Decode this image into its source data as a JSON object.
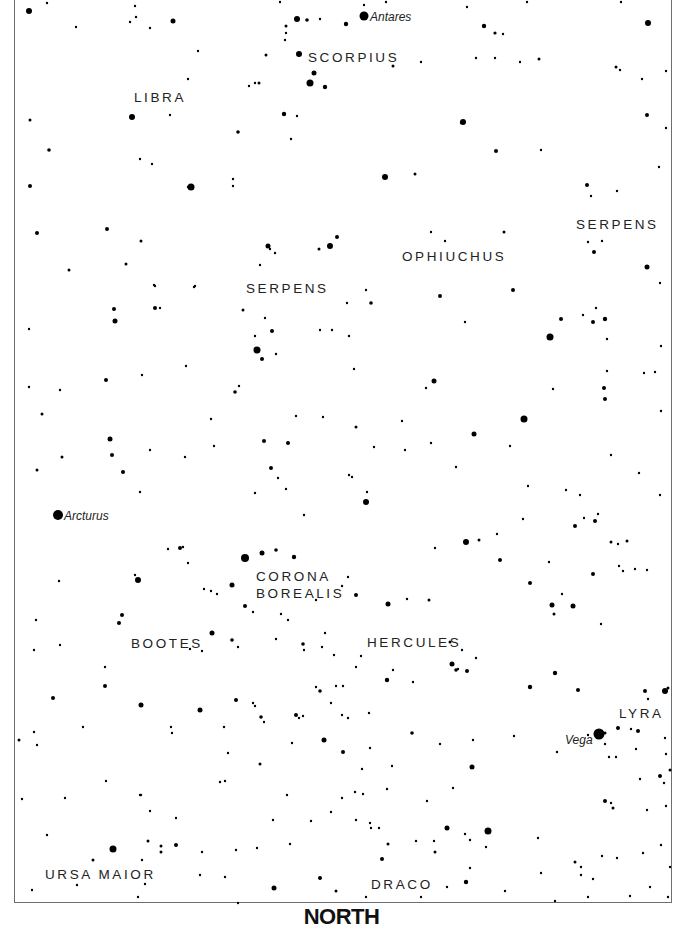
{
  "chart": {
    "direction_label": "NORTH",
    "frame": {
      "left": 14,
      "right": 672,
      "bottom": 904
    },
    "colors": {
      "star": "#000000",
      "label": "#222222",
      "frame": "#6e6e6e",
      "background": "#ffffff"
    }
  },
  "constellations": [
    {
      "name": "SCORPIUS",
      "x": 308,
      "y": 62
    },
    {
      "name": "LIBRA",
      "x": 134,
      "y": 102
    },
    {
      "name": "SERPENS",
      "x": 576,
      "y": 229
    },
    {
      "name": "OPHIUCHUS",
      "x": 402,
      "y": 261
    },
    {
      "name": "SERPENS",
      "x": 246,
      "y": 293
    },
    {
      "name": "CORONA",
      "x": 256,
      "y": 581
    },
    {
      "name": "BOREALIS",
      "x": 256,
      "y": 598
    },
    {
      "name": "BOOTES",
      "x": 131,
      "y": 648
    },
    {
      "name": "HERCULES",
      "x": 367,
      "y": 647
    },
    {
      "name": "LYRA",
      "x": 619,
      "y": 718
    },
    {
      "name": "URSA MAIOR",
      "x": 45,
      "y": 879
    },
    {
      "name": "DRACO",
      "x": 371,
      "y": 889
    }
  ],
  "named_stars": [
    {
      "name": "Antares",
      "x": 364,
      "y": 16,
      "r": 4.5,
      "label_x": 370,
      "label_y": 21
    },
    {
      "name": "Arcturus",
      "x": 58,
      "y": 515,
      "r": 5,
      "label_x": 64,
      "label_y": 520
    },
    {
      "name": "Vega",
      "x": 599,
      "y": 734,
      "r": 5.5,
      "label_x": 565,
      "label_y": 744
    }
  ],
  "stars": [
    [
      29,
      11,
      3
    ],
    [
      47,
      3,
      1.2
    ],
    [
      135,
      6,
      1.2
    ],
    [
      173,
      21,
      2.5
    ],
    [
      297,
      19,
      3
    ],
    [
      307,
      20,
      1.8
    ],
    [
      320,
      19,
      1.2
    ],
    [
      346,
      24,
      2.2
    ],
    [
      467,
      7,
      1.2
    ],
    [
      484,
      26,
      2.2
    ],
    [
      495,
      33,
      1.6
    ],
    [
      503,
      34,
      1.2
    ],
    [
      648,
      23,
      3
    ],
    [
      621,
      2,
      1.2
    ],
    [
      527,
      2,
      1.2
    ],
    [
      280,
      2,
      1.2
    ],
    [
      386,
      2,
      1.2
    ],
    [
      364,
      5,
      1.2
    ],
    [
      299,
      54,
      3
    ],
    [
      286,
      26,
      1.5
    ],
    [
      286,
      33,
      1.2
    ],
    [
      285,
      40,
      1.2
    ],
    [
      266,
      55,
      1.5
    ],
    [
      255,
      83,
      1.2
    ],
    [
      188,
      79,
      1.2
    ],
    [
      76,
      27,
      1.2
    ],
    [
      130,
      22,
      1.2
    ],
    [
      136,
      17,
      1.2
    ],
    [
      150,
      28,
      1.2
    ],
    [
      198,
      51,
      1.2
    ],
    [
      314,
      73,
      2.5
    ],
    [
      310,
      83,
      3.5
    ],
    [
      325,
      87,
      2.2
    ],
    [
      284,
      114,
      2.2
    ],
    [
      297,
      116,
      1.2
    ],
    [
      238,
      132,
      1.8
    ],
    [
      291,
      139,
      1.2
    ],
    [
      259,
      83,
      1.5
    ],
    [
      249,
      86,
      1.2
    ],
    [
      393,
      66,
      1.5
    ],
    [
      421,
      62,
      1.2
    ],
    [
      495,
      58,
      1.2
    ],
    [
      476,
      58,
      1.2
    ],
    [
      520,
      62,
      1.2
    ],
    [
      539,
      59,
      1.5
    ],
    [
      616,
      67,
      1.5
    ],
    [
      620,
      70,
      1.2
    ],
    [
      666,
      71,
      1.2
    ],
    [
      132,
      117,
      3
    ],
    [
      170,
      115,
      1.2
    ],
    [
      30,
      120,
      1.5
    ],
    [
      49,
      150,
      1.8
    ],
    [
      30,
      186,
      2
    ],
    [
      191,
      187,
      3.5
    ],
    [
      233,
      186,
      1.2
    ],
    [
      233,
      179,
      1.2
    ],
    [
      140,
      159,
      1.2
    ],
    [
      152,
      164,
      1.2
    ],
    [
      188,
      187,
      1.2
    ],
    [
      463,
      122,
      3
    ],
    [
      461,
      123,
      1.2
    ],
    [
      385,
      177,
      3
    ],
    [
      415,
      174,
      1.5
    ],
    [
      496,
      151,
      2
    ],
    [
      541,
      150,
      1.2
    ],
    [
      587,
      185,
      2
    ],
    [
      591,
      196,
      1.2
    ],
    [
      647,
      115,
      2
    ],
    [
      642,
      79,
      1.2
    ],
    [
      666,
      128,
      1.2
    ],
    [
      617,
      191,
      1.2
    ],
    [
      659,
      167,
      1.2
    ],
    [
      37,
      233,
      2
    ],
    [
      107,
      229,
      2
    ],
    [
      69,
      270,
      1.5
    ],
    [
      141,
      241,
      1.5
    ],
    [
      126,
      264,
      1.5
    ],
    [
      155,
      286,
      1.2
    ],
    [
      154,
      285,
      1.2
    ],
    [
      195,
      286,
      1.2
    ],
    [
      160,
      308,
      1.2
    ],
    [
      268,
      246,
      2.5
    ],
    [
      270,
      249,
      1.2
    ],
    [
      330,
      246,
      3
    ],
    [
      337,
      237,
      2
    ],
    [
      319,
      249,
      1.5
    ],
    [
      260,
      265,
      1.2
    ],
    [
      275,
      253,
      1.2
    ],
    [
      366,
      290,
      1.2
    ],
    [
      371,
      303,
      1.8
    ],
    [
      347,
      303,
      1.2
    ],
    [
      431,
      232,
      1.2
    ],
    [
      445,
      241,
      1.2
    ],
    [
      504,
      232,
      1.5
    ],
    [
      594,
      252,
      2
    ],
    [
      647,
      267,
      2.5
    ],
    [
      588,
      242,
      1.2
    ],
    [
      602,
      241,
      1.2
    ],
    [
      660,
      283,
      1.2
    ],
    [
      114,
      309,
      2
    ],
    [
      29,
      329,
      1.2
    ],
    [
      115,
      321,
      2.5
    ],
    [
      155,
      308,
      2
    ],
    [
      194,
      287,
      1.2
    ],
    [
      243,
      310,
      1.5
    ],
    [
      272,
      331,
      2
    ],
    [
      255,
      336,
      1.2
    ],
    [
      265,
      318,
      1.2
    ],
    [
      257,
      350,
      3.5
    ],
    [
      262,
      359,
      2
    ],
    [
      276,
      354,
      1.2
    ],
    [
      320,
      330,
      1.2
    ],
    [
      332,
      330,
      1.2
    ],
    [
      349,
      336,
      1.2
    ],
    [
      440,
      296,
      2
    ],
    [
      465,
      322,
      1.2
    ],
    [
      513,
      290,
      2
    ],
    [
      550,
      337,
      3.5
    ],
    [
      561,
      319,
      2
    ],
    [
      593,
      322,
      2
    ],
    [
      605,
      319,
      2.2
    ],
    [
      583,
      315,
      1.2
    ],
    [
      596,
      308,
      1.2
    ],
    [
      607,
      339,
      1.2
    ],
    [
      661,
      346,
      1.2
    ],
    [
      29,
      387,
      1.2
    ],
    [
      60,
      390,
      1.2
    ],
    [
      106,
      380,
      2
    ],
    [
      142,
      375,
      1.2
    ],
    [
      186,
      366,
      1.2
    ],
    [
      235,
      392,
      1.8
    ],
    [
      239,
      386,
      1.2
    ],
    [
      354,
      369,
      1.2
    ],
    [
      296,
      416,
      1.2
    ],
    [
      211,
      419,
      1.2
    ],
    [
      434,
      381,
      2.5
    ],
    [
      426,
      388,
      1.2
    ],
    [
      474,
      434,
      2.5
    ],
    [
      524,
      419,
      3.5
    ],
    [
      604,
      388,
      2
    ],
    [
      605,
      399,
      2
    ],
    [
      553,
      389,
      1.2
    ],
    [
      607,
      371,
      1.2
    ],
    [
      655,
      372,
      1.2
    ],
    [
      644,
      373,
      1.2
    ],
    [
      661,
      411,
      1.2
    ],
    [
      42,
      414,
      1.5
    ],
    [
      110,
      439,
      2.5
    ],
    [
      264,
      441,
      2
    ],
    [
      288,
      443,
      2
    ],
    [
      356,
      427,
      1.5
    ],
    [
      323,
      417,
      1.2
    ],
    [
      214,
      446,
      1.2
    ],
    [
      271,
      468,
      2
    ],
    [
      352,
      477,
      1.2
    ],
    [
      402,
      421,
      1.2
    ],
    [
      431,
      443,
      1.2
    ],
    [
      456,
      467,
      1.2
    ],
    [
      374,
      447,
      1.2
    ],
    [
      405,
      450,
      1.2
    ],
    [
      510,
      446,
      1.2
    ],
    [
      611,
      455,
      1.2
    ],
    [
      112,
      455,
      2
    ],
    [
      123,
      472,
      2
    ],
    [
      140,
      492,
      1.2
    ],
    [
      37,
      470,
      1.5
    ],
    [
      62,
      457,
      1.5
    ],
    [
      150,
      450,
      1.2
    ],
    [
      185,
      457,
      1.2
    ],
    [
      255,
      493,
      1.2
    ],
    [
      278,
      478,
      1.2
    ],
    [
      304,
      515,
      1.2
    ],
    [
      286,
      489,
      1.2
    ],
    [
      349,
      475,
      1.2
    ],
    [
      366,
      502,
      3
    ],
    [
      367,
      492,
      1.2
    ],
    [
      466,
      542,
      3
    ],
    [
      479,
      540,
      1.5
    ],
    [
      497,
      534,
      1.2
    ],
    [
      523,
      519,
      1.2
    ],
    [
      528,
      486,
      1.2
    ],
    [
      566,
      490,
      1.2
    ],
    [
      580,
      495,
      1.2
    ],
    [
      639,
      473,
      1.2
    ],
    [
      660,
      495,
      1.2
    ],
    [
      575,
      526,
      2
    ],
    [
      595,
      521,
      2
    ],
    [
      584,
      518,
      1.2
    ],
    [
      598,
      514,
      1.2
    ],
    [
      627,
      541,
      1.5
    ],
    [
      611,
      542,
      1.5
    ],
    [
      618,
      544,
      1.2
    ],
    [
      593,
      574,
      2
    ],
    [
      635,
      569,
      1.2
    ],
    [
      647,
      570,
      1.2
    ],
    [
      623,
      571,
      1.2
    ],
    [
      59,
      581,
      1.2
    ],
    [
      138,
      580,
      3
    ],
    [
      135,
      575,
      1.2
    ],
    [
      180,
      548,
      2
    ],
    [
      183,
      547,
      1.2
    ],
    [
      168,
      549,
      1.2
    ],
    [
      188,
      563,
      1.2
    ],
    [
      204,
      589,
      1.2
    ],
    [
      211,
      591,
      1.2
    ],
    [
      217,
      594,
      1.2
    ],
    [
      232,
      585,
      2.5
    ],
    [
      245,
      558,
      4
    ],
    [
      262,
      553,
      2.5
    ],
    [
      276,
      550,
      1.8
    ],
    [
      294,
      557,
      2.2
    ],
    [
      245,
      606,
      2
    ],
    [
      253,
      612,
      1.2
    ],
    [
      281,
      614,
      1.2
    ],
    [
      288,
      620,
      1.2
    ],
    [
      316,
      600,
      1.2
    ],
    [
      342,
      586,
      1.2
    ],
    [
      348,
      577,
      1.2
    ],
    [
      356,
      595,
      2
    ],
    [
      388,
      604,
      2.5
    ],
    [
      407,
      599,
      1.2
    ],
    [
      429,
      600,
      1.5
    ],
    [
      435,
      548,
      1.2
    ],
    [
      500,
      560,
      2
    ],
    [
      530,
      583,
      2
    ],
    [
      549,
      562,
      1.2
    ],
    [
      552,
      605,
      2.5
    ],
    [
      562,
      594,
      1.2
    ],
    [
      573,
      606,
      2.5
    ],
    [
      554,
      614,
      1.5
    ],
    [
      601,
      624,
      1.2
    ],
    [
      619,
      566,
      1.2
    ],
    [
      122,
      615,
      2
    ],
    [
      119,
      623,
      2
    ],
    [
      36,
      620,
      1.2
    ],
    [
      34,
      650,
      1.2
    ],
    [
      60,
      645,
      1.2
    ],
    [
      105,
      667,
      1.2
    ],
    [
      190,
      649,
      1.2
    ],
    [
      202,
      651,
      1.2
    ],
    [
      232,
      640,
      1.8
    ],
    [
      212,
      633,
      2.5
    ],
    [
      238,
      647,
      1.2
    ],
    [
      276,
      639,
      1.2
    ],
    [
      303,
      644,
      1.8
    ],
    [
      325,
      633,
      1.2
    ],
    [
      304,
      650,
      1.2
    ],
    [
      322,
      647,
      1.2
    ],
    [
      334,
      655,
      1.2
    ],
    [
      450,
      642,
      1.5
    ],
    [
      462,
      650,
      1.2
    ],
    [
      458,
      669,
      1.2
    ],
    [
      476,
      658,
      1.2
    ],
    [
      452,
      664,
      2.5
    ],
    [
      456,
      670,
      1.8
    ],
    [
      467,
      671,
      2
    ],
    [
      387,
      680,
      2.2
    ],
    [
      413,
      682,
      1.2
    ],
    [
      393,
      670,
      1.2
    ],
    [
      361,
      656,
      1.2
    ],
    [
      356,
      667,
      1.2
    ],
    [
      336,
      686,
      1.2
    ],
    [
      343,
      686,
      1.2
    ],
    [
      369,
      713,
      1.2
    ],
    [
      53,
      698,
      2
    ],
    [
      105,
      686,
      2
    ],
    [
      141,
      705,
      2.5
    ],
    [
      200,
      710,
      2.5
    ],
    [
      236,
      700,
      2
    ],
    [
      255,
      706,
      1.2
    ],
    [
      253,
      703,
      1.2
    ],
    [
      261,
      717,
      1.8
    ],
    [
      264,
      722,
      1.2
    ],
    [
      296,
      715,
      2
    ],
    [
      299,
      718,
      1.2
    ],
    [
      316,
      687,
      1.2
    ],
    [
      320,
      691,
      1.8
    ],
    [
      331,
      703,
      1.2
    ],
    [
      342,
      715,
      1.2
    ],
    [
      348,
      718,
      1.2
    ],
    [
      303,
      716,
      1.2
    ],
    [
      530,
      687,
      2.2
    ],
    [
      555,
      673,
      2.2
    ],
    [
      578,
      690,
      2
    ],
    [
      605,
      733,
      1.5
    ],
    [
      618,
      728,
      2
    ],
    [
      638,
      731,
      2
    ],
    [
      645,
      691,
      2
    ],
    [
      665,
      691,
      3
    ],
    [
      668,
      688,
      1.5
    ],
    [
      648,
      699,
      1.2
    ],
    [
      631,
      729,
      1.2
    ],
    [
      636,
      749,
      1.2
    ],
    [
      665,
      738,
      1.2
    ],
    [
      660,
      776,
      2
    ],
    [
      640,
      779,
      1.2
    ],
    [
      609,
      757,
      1.2
    ],
    [
      605,
      744,
      1.2
    ],
    [
      19,
      740,
      1.5
    ],
    [
      34,
      732,
      1.2
    ],
    [
      37,
      745,
      1.2
    ],
    [
      83,
      727,
      1.2
    ],
    [
      171,
      727,
      1.2
    ],
    [
      172,
      733,
      1.2
    ],
    [
      228,
      753,
      1.2
    ],
    [
      224,
      727,
      1.2
    ],
    [
      260,
      764,
      1.5
    ],
    [
      292,
      743,
      1.2
    ],
    [
      324,
      740,
      2.5
    ],
    [
      343,
      752,
      2
    ],
    [
      370,
      748,
      1.2
    ],
    [
      392,
      766,
      1.2
    ],
    [
      362,
      769,
      1.2
    ],
    [
      412,
      733,
      1.8
    ],
    [
      472,
      767,
      2.5
    ],
    [
      440,
      744,
      1.2
    ],
    [
      473,
      740,
      1.2
    ],
    [
      514,
      736,
      1.2
    ],
    [
      557,
      752,
      1.2
    ],
    [
      616,
      757,
      1.2
    ],
    [
      588,
      735,
      1.2
    ],
    [
      605,
      801,
      2
    ],
    [
      666,
      754,
      1.2
    ],
    [
      664,
      783,
      1.2
    ],
    [
      670,
      770,
      1.5
    ],
    [
      22,
      799,
      1.2
    ],
    [
      140,
      795,
      1.2
    ],
    [
      106,
      781,
      1.2
    ],
    [
      225,
      781,
      1.2
    ],
    [
      287,
      795,
      1.2
    ],
    [
      331,
      812,
      1.2
    ],
    [
      342,
      798,
      1.2
    ],
    [
      355,
      792,
      1.2
    ],
    [
      363,
      794,
      1.2
    ],
    [
      387,
      789,
      1.2
    ],
    [
      427,
      801,
      1.2
    ],
    [
      453,
      788,
      1.2
    ],
    [
      611,
      803,
      1.2
    ],
    [
      647,
      810,
      1.2
    ],
    [
      666,
      806,
      1.2
    ],
    [
      220,
      782,
      1.2
    ],
    [
      47,
      835,
      1.2
    ],
    [
      65,
      798,
      1.2
    ],
    [
      113,
      849,
      3.5
    ],
    [
      93,
      860,
      1.5
    ],
    [
      141,
      795,
      1.2
    ],
    [
      148,
      841,
      1.5
    ],
    [
      161,
      846,
      1.5
    ],
    [
      161,
      852,
      1.5
    ],
    [
      176,
      845,
      2
    ],
    [
      150,
      811,
      1.2
    ],
    [
      142,
      860,
      1.2
    ],
    [
      176,
      818,
      1.2
    ],
    [
      202,
      852,
      1.2
    ],
    [
      236,
      850,
      1.2
    ],
    [
      257,
      848,
      1.2
    ],
    [
      274,
      888,
      2.5
    ],
    [
      273,
      820,
      1.2
    ],
    [
      290,
      844,
      1.2
    ],
    [
      311,
      821,
      1.2
    ],
    [
      320,
      878,
      2
    ],
    [
      336,
      891,
      1.5
    ],
    [
      356,
      820,
      1.2
    ],
    [
      370,
      823,
      1.2
    ],
    [
      371,
      828,
      1.2
    ],
    [
      379,
      828,
      1.2
    ],
    [
      382,
      859,
      2
    ],
    [
      388,
      844,
      1.5
    ],
    [
      416,
      841,
      1.2
    ],
    [
      434,
      841,
      1.2
    ],
    [
      435,
      852,
      1.5
    ],
    [
      447,
      828,
      2.5
    ],
    [
      465,
      834,
      1.2
    ],
    [
      470,
      840,
      1.2
    ],
    [
      488,
      831,
      3.5
    ],
    [
      486,
      847,
      1.2
    ],
    [
      466,
      882,
      2.2
    ],
    [
      470,
      868,
      1.2
    ],
    [
      538,
      838,
      1.2
    ],
    [
      541,
      873,
      1.2
    ],
    [
      575,
      862,
      1.5
    ],
    [
      581,
      867,
      1.2
    ],
    [
      581,
      875,
      1.2
    ],
    [
      593,
      879,
      1.2
    ],
    [
      613,
      808,
      1.5
    ],
    [
      602,
      856,
      1.2
    ],
    [
      617,
      858,
      1.2
    ],
    [
      643,
      853,
      1.2
    ],
    [
      661,
      845,
      1.2
    ],
    [
      670,
      867,
      1.2
    ],
    [
      668,
      897,
      1.2
    ],
    [
      555,
      901,
      1.2
    ],
    [
      588,
      897,
      1.2
    ],
    [
      630,
      896,
      1.2
    ],
    [
      650,
      887,
      1.2
    ],
    [
      32,
      890,
      1.2
    ],
    [
      77,
      885,
      1.2
    ],
    [
      138,
      897,
      1.2
    ],
    [
      145,
      884,
      1.2
    ],
    [
      200,
      875,
      1.2
    ],
    [
      225,
      877,
      1.2
    ],
    [
      238,
      903,
      1.2
    ],
    [
      366,
      897,
      1.2
    ],
    [
      421,
      897,
      1.2
    ],
    [
      447,
      887,
      1.2
    ],
    [
      505,
      891,
      1.2
    ]
  ]
}
